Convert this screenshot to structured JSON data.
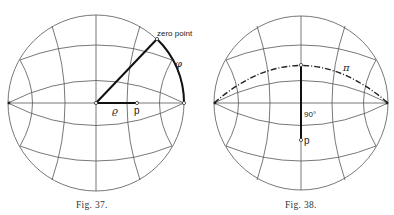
{
  "figures": [
    {
      "caption": "Fig. 37.",
      "labels": {
        "zero_point": "zero point",
        "phi": "φ",
        "rho": "ϱ",
        "p": "p"
      }
    },
    {
      "caption": "Fig. 38.",
      "labels": {
        "pi": "π",
        "angle": "90°",
        "p": "p"
      }
    }
  ]
}
